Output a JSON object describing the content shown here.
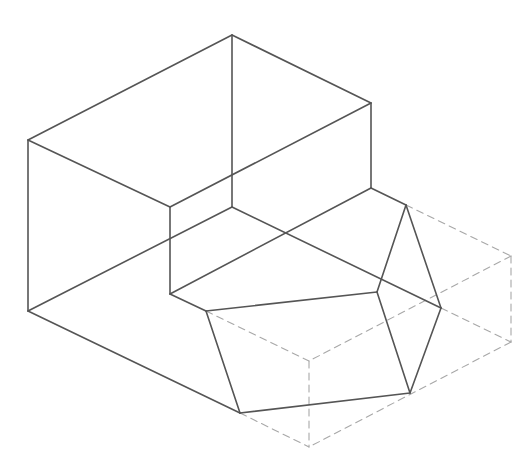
{
  "diagram": {
    "type": "isometric-wireframe",
    "canvas": {
      "width": 529,
      "height": 462,
      "background": "#ffffff"
    },
    "colors": {
      "visible_edge": "#555555",
      "hidden_edge": "#a8a8a8"
    },
    "stroke": {
      "visible_width": 1.6,
      "hidden_width": 1.1,
      "hidden_dash": "7 5"
    },
    "vertices": {
      "A": [
        232,
        35
      ],
      "B": [
        28,
        140
      ],
      "C": [
        371,
        103
      ],
      "D": [
        170,
        207
      ],
      "E": [
        232,
        207
      ],
      "F": [
        28,
        311
      ],
      "G": [
        371,
        188
      ],
      "H": [
        170,
        294
      ],
      "I": [
        406,
        205
      ],
      "J": [
        206,
        311
      ],
      "K": [
        377,
        292
      ],
      "L": [
        441,
        308
      ],
      "M": [
        240,
        413
      ],
      "N": [
        410,
        393
      ],
      "P": [
        511,
        256
      ],
      "Q": [
        511,
        342
      ],
      "R": [
        309,
        361
      ],
      "S": [
        309,
        447
      ]
    },
    "visible_edges": [
      [
        "A",
        "B"
      ],
      [
        "A",
        "C"
      ],
      [
        "A",
        "E"
      ],
      [
        "B",
        "D"
      ],
      [
        "B",
        "F"
      ],
      [
        "C",
        "D"
      ],
      [
        "C",
        "G"
      ],
      [
        "D",
        "H"
      ],
      [
        "E",
        "F"
      ],
      [
        "E",
        "L"
      ],
      [
        "F",
        "M"
      ],
      [
        "G",
        "I"
      ],
      [
        "G",
        "H"
      ],
      [
        "H",
        "J"
      ],
      [
        "I",
        "K"
      ],
      [
        "I",
        "L"
      ],
      [
        "J",
        "K"
      ],
      [
        "J",
        "M"
      ],
      [
        "K",
        "N"
      ],
      [
        "L",
        "N"
      ],
      [
        "M",
        "N"
      ]
    ],
    "hidden_edges": [
      [
        "I",
        "P"
      ],
      [
        "P",
        "Q"
      ],
      [
        "L",
        "Q"
      ],
      [
        "Q",
        "S"
      ],
      [
        "P",
        "R"
      ],
      [
        "J",
        "R"
      ],
      [
        "R",
        "S"
      ],
      [
        "M",
        "S"
      ]
    ]
  }
}
